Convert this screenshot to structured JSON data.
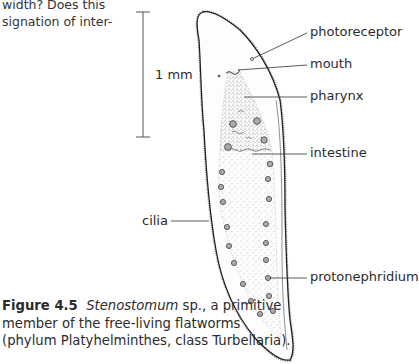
{
  "body_text": {
    "lines": [
      "width? Does this",
      "signation of inter-"
    ]
  },
  "figure": {
    "scale_bar_label": "1 mm",
    "labels": {
      "photoreceptor": "photoreceptor",
      "mouth": "mouth",
      "pharynx": "pharynx",
      "intestine": "intestine",
      "cilia": "cilia",
      "protonephridium": "protonephridium"
    }
  },
  "caption": {
    "figure_number": "Figure 4.5",
    "genus": "Stenostomum",
    "line1_rest": " sp., a primitive",
    "line2": "member of the free-living flatworms",
    "line3": "(phylum Platyhelminthes, class Turbellaria)."
  }
}
